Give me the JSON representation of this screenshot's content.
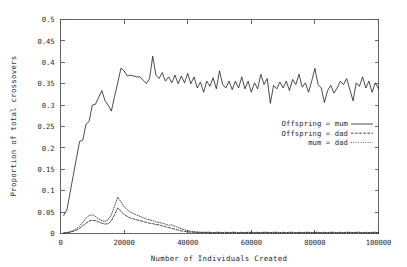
{
  "chart_data": {
    "type": "line",
    "title": "",
    "xlabel": "Number of Individuals Created",
    "ylabel": "Proportion of total crossovers",
    "xlim": [
      0,
      100000
    ],
    "ylim": [
      0,
      0.5
    ],
    "xticks": [
      0,
      20000,
      40000,
      60000,
      80000,
      100000
    ],
    "xtick_labels": [
      "0",
      "20000",
      "40000",
      "60000",
      "80000",
      "100000"
    ],
    "yticks": [
      0,
      0.05,
      0.1,
      0.15,
      0.2,
      0.25,
      0.3,
      0.35,
      0.4,
      0.45,
      0.5
    ],
    "ytick_labels": [
      "0",
      "0.05",
      "0.1",
      "0.15",
      "0.2",
      "0.25",
      "0.3",
      "0.35",
      "0.4",
      "0.45",
      "0.5"
    ],
    "grid": false,
    "legend_position": "center-right",
    "legend": [
      {
        "name": "Offspring = mum",
        "style": "solid"
      },
      {
        "name": "Offspring = dad",
        "style": "dashed"
      },
      {
        "name": "mum = dad",
        "style": "dotted"
      }
    ],
    "x": [
      1000,
      2000,
      3000,
      4000,
      5000,
      6000,
      7000,
      8000,
      9000,
      10000,
      11000,
      12000,
      13000,
      14000,
      15000,
      16000,
      17000,
      18000,
      19000,
      20000,
      21000,
      22000,
      23000,
      24000,
      25000,
      26000,
      27000,
      28000,
      29000,
      30000,
      31000,
      32000,
      33000,
      34000,
      35000,
      36000,
      37000,
      38000,
      39000,
      40000,
      41000,
      42000,
      43000,
      44000,
      45000,
      46000,
      47000,
      48000,
      49000,
      50000,
      51000,
      52000,
      53000,
      54000,
      55000,
      56000,
      57000,
      58000,
      59000,
      60000,
      61000,
      62000,
      63000,
      64000,
      65000,
      66000,
      67000,
      68000,
      69000,
      70000,
      71000,
      72000,
      73000,
      74000,
      75000,
      76000,
      77000,
      78000,
      79000,
      80000,
      81000,
      82000,
      83000,
      84000,
      85000,
      86000,
      87000,
      88000,
      89000,
      90000,
      91000,
      92000,
      93000,
      94000,
      95000,
      96000,
      97000,
      98000,
      99000,
      100000
    ],
    "series": [
      {
        "name": "Offspring = mum",
        "style": "solid",
        "values": [
          0.042,
          0.055,
          0.095,
          0.135,
          0.175,
          0.215,
          0.218,
          0.255,
          0.262,
          0.3,
          0.302,
          0.318,
          0.334,
          0.31,
          0.3,
          0.286,
          0.32,
          0.352,
          0.386,
          0.38,
          0.368,
          0.37,
          0.368,
          0.366,
          0.366,
          0.358,
          0.35,
          0.362,
          0.414,
          0.37,
          0.362,
          0.376,
          0.356,
          0.366,
          0.352,
          0.37,
          0.35,
          0.368,
          0.352,
          0.374,
          0.35,
          0.366,
          0.34,
          0.354,
          0.33,
          0.356,
          0.344,
          0.364,
          0.338,
          0.38,
          0.348,
          0.34,
          0.356,
          0.336,
          0.356,
          0.34,
          0.366,
          0.338,
          0.356,
          0.33,
          0.352,
          0.338,
          0.372,
          0.348,
          0.362,
          0.304,
          0.346,
          0.338,
          0.354,
          0.34,
          0.356,
          0.334,
          0.36,
          0.348,
          0.372,
          0.342,
          0.352,
          0.33,
          0.356,
          0.386,
          0.348,
          0.34,
          0.306,
          0.334,
          0.346,
          0.328,
          0.34,
          0.356,
          0.348,
          0.362,
          0.336,
          0.31,
          0.352,
          0.344,
          0.366,
          0.34,
          0.356,
          0.33,
          0.352,
          0.338
        ]
      },
      {
        "name": "Offspring = dad",
        "style": "dashed",
        "values": [
          0.001,
          0.002,
          0.003,
          0.005,
          0.008,
          0.012,
          0.018,
          0.024,
          0.029,
          0.031,
          0.03,
          0.027,
          0.024,
          0.022,
          0.023,
          0.03,
          0.044,
          0.06,
          0.052,
          0.044,
          0.04,
          0.036,
          0.034,
          0.032,
          0.03,
          0.028,
          0.026,
          0.024,
          0.023,
          0.021,
          0.02,
          0.018,
          0.016,
          0.014,
          0.012,
          0.01,
          0.008,
          0.006,
          0.005,
          0.004,
          0.003,
          0.003,
          0.002,
          0.002,
          0.002,
          0.002,
          0.002,
          0.001,
          0.002,
          0.002,
          0.001,
          0.002,
          0.001,
          0.002,
          0.002,
          0.001,
          0.002,
          0.001,
          0.002,
          0.002,
          0.001,
          0.002,
          0.001,
          0.002,
          0.002,
          0.001,
          0.002,
          0.002,
          0.001,
          0.002,
          0.001,
          0.002,
          0.002,
          0.001,
          0.002,
          0.001,
          0.002,
          0.002,
          0.001,
          0.002,
          0.002,
          0.001,
          0.002,
          0.001,
          0.002,
          0.002,
          0.001,
          0.002,
          0.001,
          0.002,
          0.002,
          0.001,
          0.002,
          0.002,
          0.001,
          0.002,
          0.001,
          0.002,
          0.002,
          0.001
        ]
      },
      {
        "name": "mum = dad",
        "style": "dotted",
        "values": [
          0.001,
          0.002,
          0.004,
          0.007,
          0.011,
          0.017,
          0.026,
          0.036,
          0.042,
          0.044,
          0.04,
          0.034,
          0.03,
          0.028,
          0.032,
          0.044,
          0.064,
          0.085,
          0.074,
          0.062,
          0.056,
          0.05,
          0.046,
          0.043,
          0.04,
          0.037,
          0.034,
          0.032,
          0.03,
          0.027,
          0.026,
          0.024,
          0.022,
          0.019,
          0.02,
          0.017,
          0.014,
          0.011,
          0.009,
          0.007,
          0.005,
          0.004,
          0.004,
          0.003,
          0.003,
          0.003,
          0.003,
          0.002,
          0.003,
          0.003,
          0.002,
          0.003,
          0.002,
          0.003,
          0.003,
          0.002,
          0.003,
          0.002,
          0.003,
          0.003,
          0.002,
          0.003,
          0.002,
          0.003,
          0.003,
          0.002,
          0.003,
          0.003,
          0.002,
          0.003,
          0.002,
          0.003,
          0.003,
          0.002,
          0.003,
          0.002,
          0.003,
          0.003,
          0.002,
          0.003,
          0.003,
          0.002,
          0.003,
          0.002,
          0.003,
          0.003,
          0.002,
          0.003,
          0.002,
          0.003,
          0.003,
          0.002,
          0.003,
          0.003,
          0.002,
          0.003,
          0.002,
          0.003,
          0.003,
          0.002
        ]
      }
    ]
  }
}
